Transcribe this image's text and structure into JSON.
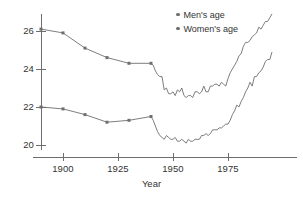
{
  "chart_data": {
    "type": "line",
    "title": "",
    "xlabel": "Year",
    "ylabel": "",
    "xlim": [
      1888,
      1996
    ],
    "ylim": [
      19.4,
      27.4
    ],
    "grid": false,
    "legend_position": "top-right",
    "xticks": [
      1900,
      1925,
      1950,
      1975
    ],
    "xtick_labels": [
      "1900",
      "1925",
      "1950",
      "1975"
    ],
    "yticks": [
      20,
      22,
      24,
      26
    ],
    "ytick_labels": [
      "20",
      "22",
      "24",
      "26"
    ],
    "series": [
      {
        "name": "Men's age",
        "color": "#6e6e6e",
        "marker": "square",
        "marker_years": [
          1890,
          1900,
          1910,
          1920,
          1930,
          1940
        ],
        "x": [
          1890,
          1900,
          1910,
          1920,
          1930,
          1940,
          1941,
          1942,
          1943,
          1944,
          1945,
          1946,
          1947,
          1948,
          1949,
          1950,
          1951,
          1952,
          1953,
          1954,
          1955,
          1956,
          1957,
          1958,
          1959,
          1960,
          1961,
          1962,
          1963,
          1964,
          1965,
          1966,
          1967,
          1968,
          1969,
          1970,
          1971,
          1972,
          1973,
          1974,
          1975,
          1976,
          1977,
          1978,
          1979,
          1980,
          1981,
          1982,
          1983,
          1984,
          1985,
          1986,
          1987,
          1988,
          1989,
          1990,
          1991,
          1992,
          1993,
          1994,
          1995
        ],
        "y": [
          26.1,
          25.9,
          25.1,
          24.6,
          24.3,
          24.3,
          24.2,
          23.9,
          23.7,
          23.6,
          23.6,
          22.9,
          23.0,
          22.7,
          22.7,
          22.8,
          22.6,
          22.9,
          22.8,
          23.0,
          22.6,
          22.5,
          22.6,
          22.6,
          22.5,
          22.8,
          22.8,
          22.7,
          22.8,
          23.1,
          22.8,
          22.8,
          23.1,
          23.1,
          23.2,
          23.2,
          23.1,
          23.3,
          23.2,
          23.1,
          23.5,
          23.8,
          24.0,
          24.2,
          24.4,
          24.7,
          24.8,
          25.2,
          25.4,
          25.4,
          25.5,
          25.7,
          25.8,
          25.9,
          26.2,
          26.1,
          26.3,
          26.5,
          26.5,
          26.7,
          26.9
        ]
      },
      {
        "name": "Women's age",
        "color": "#6e6e6e",
        "marker": "square",
        "marker_years": [
          1890,
          1900,
          1910,
          1920,
          1930,
          1940
        ],
        "x": [
          1890,
          1900,
          1910,
          1920,
          1930,
          1940,
          1941,
          1942,
          1943,
          1944,
          1945,
          1946,
          1947,
          1948,
          1949,
          1950,
          1951,
          1952,
          1953,
          1954,
          1955,
          1956,
          1957,
          1958,
          1959,
          1960,
          1961,
          1962,
          1963,
          1964,
          1965,
          1966,
          1967,
          1968,
          1969,
          1970,
          1971,
          1972,
          1973,
          1974,
          1975,
          1976,
          1977,
          1978,
          1979,
          1980,
          1981,
          1982,
          1983,
          1984,
          1985,
          1986,
          1987,
          1988,
          1989,
          1990,
          1991,
          1992,
          1993,
          1994,
          1995
        ],
        "y": [
          22.0,
          21.9,
          21.6,
          21.2,
          21.3,
          21.5,
          21.3,
          21.0,
          20.7,
          20.5,
          20.4,
          20.3,
          20.5,
          20.4,
          20.3,
          20.3,
          20.4,
          20.2,
          20.2,
          20.3,
          20.2,
          20.1,
          20.3,
          20.2,
          20.2,
          20.3,
          20.3,
          20.3,
          20.5,
          20.5,
          20.6,
          20.5,
          20.6,
          20.8,
          20.8,
          20.8,
          20.9,
          20.9,
          21.0,
          21.1,
          21.1,
          21.3,
          21.6,
          21.8,
          22.1,
          22.0,
          22.3,
          22.5,
          22.8,
          23.0,
          23.3,
          23.1,
          23.6,
          23.6,
          23.8,
          23.9,
          24.1,
          24.4,
          24.5,
          24.5,
          24.9
        ]
      }
    ]
  },
  "legend": {
    "items": [
      {
        "label": "Men's age"
      },
      {
        "label": "Women's age"
      }
    ]
  },
  "axes": {
    "x_title": "Year"
  }
}
